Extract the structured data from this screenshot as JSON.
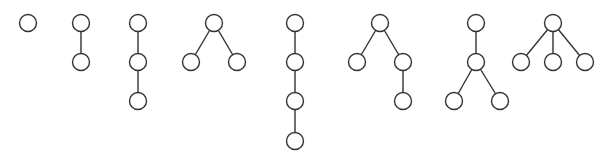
{
  "diagram": {
    "node_radius": 8.5,
    "stroke_color": "#333333",
    "background": "#ffffff",
    "trees": [
      {
        "id": "t1",
        "nodes": [
          [
            28,
            23
          ]
        ],
        "edges": []
      },
      {
        "id": "t2",
        "nodes": [
          [
            81,
            23
          ],
          [
            81,
            62
          ]
        ],
        "edges": [
          [
            0,
            1
          ]
        ]
      },
      {
        "id": "t3",
        "nodes": [
          [
            138,
            23
          ],
          [
            138,
            62
          ],
          [
            138,
            101
          ]
        ],
        "edges": [
          [
            0,
            1
          ],
          [
            1,
            2
          ]
        ]
      },
      {
        "id": "t4",
        "nodes": [
          [
            214,
            23
          ],
          [
            191,
            62
          ],
          [
            237,
            62
          ]
        ],
        "edges": [
          [
            0,
            1
          ],
          [
            0,
            2
          ]
        ]
      },
      {
        "id": "t5",
        "nodes": [
          [
            295,
            23
          ],
          [
            295,
            62
          ],
          [
            295,
            101
          ],
          [
            295,
            141
          ]
        ],
        "edges": [
          [
            0,
            1
          ],
          [
            1,
            2
          ],
          [
            2,
            3
          ]
        ]
      },
      {
        "id": "t6",
        "nodes": [
          [
            380,
            23
          ],
          [
            357,
            62
          ],
          [
            403,
            62
          ],
          [
            403,
            101
          ]
        ],
        "edges": [
          [
            0,
            1
          ],
          [
            0,
            2
          ],
          [
            2,
            3
          ]
        ]
      },
      {
        "id": "t7",
        "nodes": [
          [
            476,
            23
          ],
          [
            476,
            62
          ],
          [
            454,
            101
          ],
          [
            500,
            101
          ]
        ],
        "edges": [
          [
            0,
            1
          ],
          [
            1,
            2
          ],
          [
            1,
            3
          ]
        ]
      },
      {
        "id": "t8",
        "nodes": [
          [
            553,
            23
          ],
          [
            521,
            62
          ],
          [
            553,
            62
          ],
          [
            585,
            62
          ]
        ],
        "edges": [
          [
            0,
            1
          ],
          [
            0,
            2
          ],
          [
            0,
            3
          ]
        ]
      }
    ]
  }
}
